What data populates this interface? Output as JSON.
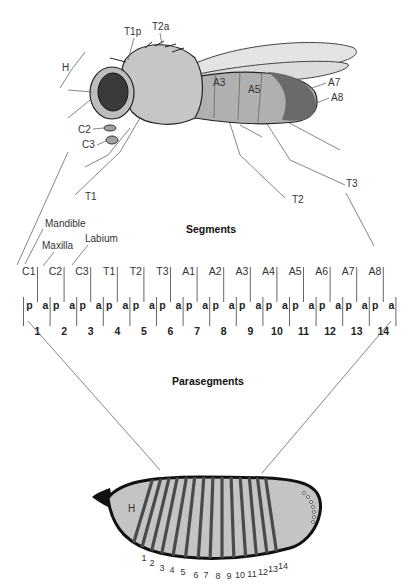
{
  "fly": {
    "labels": {
      "H": "H",
      "T1p": "T1p",
      "T2a": "T2a",
      "C2": "C2",
      "C3": "C3",
      "T1": "T1",
      "T2": "T2",
      "T3": "T3",
      "A3": "A3",
      "A5": "A5",
      "A7": "A7",
      "A8": "A8"
    }
  },
  "mouthparts": {
    "mandible": "Mandible",
    "maxilla": "Maxilla",
    "labium": "Labium"
  },
  "segments": {
    "title": "Segments",
    "labels": [
      "C1",
      "C2",
      "C3",
      "T1",
      "T2",
      "T3",
      "A1",
      "A2",
      "A3",
      "A4",
      "A5",
      "A6",
      "A7",
      "A8"
    ]
  },
  "compartments": {
    "posterior": "p",
    "anterior": "a"
  },
  "parasegments": {
    "title": "Parasegments",
    "numbers": [
      "1",
      "2",
      "3",
      "4",
      "5",
      "6",
      "7",
      "8",
      "9",
      "10",
      "11",
      "12",
      "13",
      "14"
    ]
  },
  "embryo": {
    "head_label": "H",
    "stripe_numbers": [
      "1",
      "2",
      "3",
      "4",
      "5",
      "6",
      "7",
      "8",
      "9",
      "10",
      "11",
      "12",
      "13",
      "14"
    ]
  },
  "colors": {
    "body_gray": "#b9b9b9",
    "embryo_fill": "#c4c4c4",
    "stripe": "#4a4a4a",
    "outline": "#111111",
    "eye": "#3a3a3a"
  }
}
